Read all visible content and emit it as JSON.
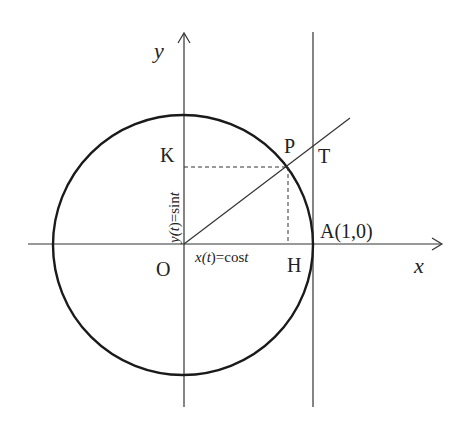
{
  "diagram": {
    "colors": {
      "stroke": "#222222",
      "background": "#ffffff"
    },
    "axes": {
      "x_label": "x",
      "y_label": "y"
    },
    "points": {
      "origin": "O",
      "P": "P",
      "T": "T",
      "K": "K",
      "H": "H",
      "A": "A(1,0)"
    },
    "annotations": {
      "cos_label_pre": "x(",
      "cos_label_t": "t",
      "cos_label_post": ")=cos",
      "cos_label_t2": "t",
      "sin_label_pre": "y(",
      "sin_label_t": "t",
      "sin_label_post": ")=sin",
      "sin_label_t2": "t"
    }
  }
}
